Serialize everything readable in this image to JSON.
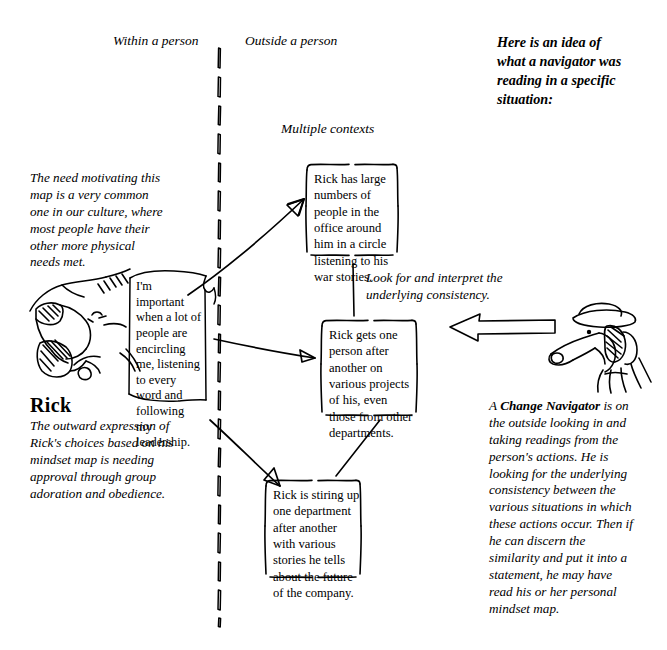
{
  "page": {
    "width": 667,
    "height": 650,
    "background": "#ffffff",
    "ink_color": "#000000"
  },
  "headers": {
    "within": "Within a person",
    "outside": "Outside a person",
    "multiple_contexts": "Multiple contexts"
  },
  "intro": {
    "text": "Here is an idea of what a navigator was reading in a specific situation:"
  },
  "notes": {
    "need_motivating": "The need motivating this map is a very common one in our culture, where most people have their other more physical needs met.",
    "outward_expression": "The outward expression of Rick's choices based on his mindset map is needing approval through group adoration and obedience.",
    "look_for": "Look for and interpret the underlying consistency.",
    "navigator_prefix": "A ",
    "navigator_bold": "Change Navigator",
    "navigator_rest": " is on the outside looking in and taking readings from the person's actions. He is looking for the underlying consistency between the various situations in which these actions occur. Then if he can discern the similarity and put it into a statement, he may have read his or her personal mindset map."
  },
  "person": {
    "name": "Rick",
    "mindset_map": "I'm important when a lot of people are encircling me, listening to every word and following my leadership."
  },
  "context_boxes": [
    {
      "id": "context-box-war-stories",
      "text": "Rick has large numbers of people in the office around him in a circle listening to his war stories."
    },
    {
      "id": "context-box-projects",
      "text": "Rick gets one person after another on various projects of his, even those from other departments."
    },
    {
      "id": "context-box-departments",
      "text": "Rick is stiring up one department after another with various stories he tells about the future of the company."
    }
  ],
  "icons": {
    "divider": "dashed-vertical-divider-icon",
    "arrow_left": "left-arrow-icon",
    "person_sketch": "rick-face-sketch-icon",
    "navigator_sketch": "navigator-dog-sketch-icon",
    "scroll": "mindset-map-scroll-icon"
  }
}
